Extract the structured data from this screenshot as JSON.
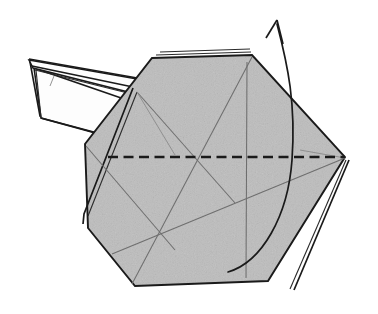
{
  "figure": {
    "name": "origami-fold-step-diagram",
    "kind": "origami instruction diagram",
    "background_color": "#ffffff",
    "paper_front_color": "#bcbcbc",
    "paper_back_color": "#fdfdfd",
    "line_color": "#1a1a1a",
    "crease_color": "#6e6e6e"
  },
  "shapes": {
    "body": {
      "name": "hexagonal-body-panel",
      "description": "large shaded hexagonal folded paper body",
      "points": "152,58 252,55 345,157 268,281 135,286 88,228 85,144"
    },
    "body_layer_top": {
      "name": "top-edge-layer-line",
      "points": "160,52 250,49"
    },
    "body_layer_top2": {
      "name": "top-edge-layer-line-inner",
      "points": "156,55 251,52"
    },
    "body_layer_left_a": {
      "name": "left-edge-layer-line-outer",
      "points": "133,88 84,214 83,224"
    },
    "body_layer_left_b": {
      "name": "left-edge-layer-line-inner",
      "points": "137,92 88,216"
    },
    "body_layer_bottomright_a": {
      "name": "bottom-right-layer-line-outer",
      "points": "349,160 294,290"
    },
    "body_layer_bottomright_b": {
      "name": "bottom-right-layer-line-inner",
      "points": "346,160 290,289"
    },
    "neck_upper": {
      "name": "neck-upper-flap",
      "points": "29,60 33,68 152,98 160,83"
    },
    "neck_lower": {
      "name": "neck-lower-flap-white",
      "points": "34,68 41,118 150,148 156,110"
    },
    "neck_white_tip": {
      "name": "neck-white-tip-panel",
      "points": "30,62 40,116 120,140"
    },
    "neck_edge_lines": [
      {
        "name": "neck-top-edge",
        "points": "29,59 160,82"
      },
      {
        "name": "neck-second-edge",
        "points": "32,66 157,92"
      },
      {
        "name": "neck-third-edge",
        "points": "35,70 152,99"
      },
      {
        "name": "neck-crease-short",
        "points": "50,86 54,76"
      },
      {
        "name": "neck-lower-edge",
        "points": "41,118 150,147"
      },
      {
        "name": "neck-inner-edge",
        "points": "36,70 41,117"
      },
      {
        "name": "neck-bottom-slant",
        "points": "95,131 132,148"
      }
    ],
    "creases": [
      {
        "name": "crease-vertical-center",
        "points": "247,62 246,278"
      },
      {
        "name": "crease-diagonal-major",
        "points": "252,57 132,284"
      },
      {
        "name": "crease-diagonal-rising",
        "points": "112,254 345,158"
      },
      {
        "name": "crease-diagonal-left",
        "points": "137,92 235,203"
      },
      {
        "name": "crease-from-left-vertex",
        "points": "86,146 175,250"
      },
      {
        "name": "crease-short-right",
        "points": "300,150 345,158"
      },
      {
        "name": "crease-upper-left",
        "points": "137,92 175,155"
      }
    ],
    "fold_line": {
      "name": "valley-fold-dashed-line",
      "points": "108,157 345,157",
      "style": "dashed",
      "meaning": "fold line"
    },
    "motion_arrow": {
      "name": "fold-direction-arrow",
      "curve": "M 228,272 C 262,262 288,216 292,160 C 296,104 288,66 277,24",
      "head_left": "266,38 277,20",
      "head_right": "277,20 283,44",
      "meaning": "fold upward / rotate flap"
    }
  },
  "labels": {
    "caption": "",
    "step_number": ""
  }
}
